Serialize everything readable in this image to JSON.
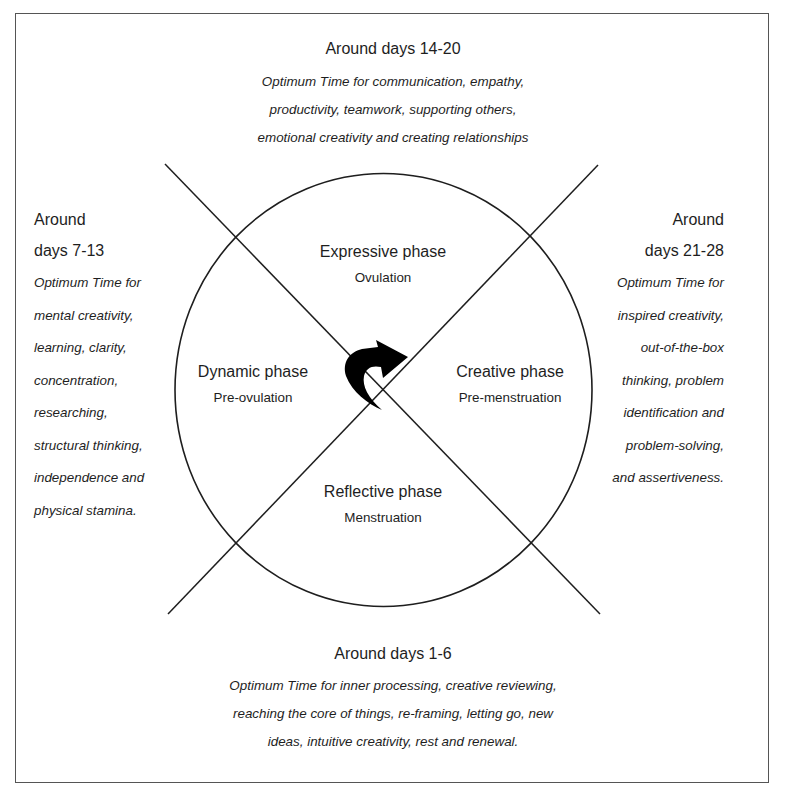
{
  "diagram": {
    "center_icon": "clockwise-curved-arrow-icon",
    "top": {
      "heading": "Around days 14-20",
      "lines": [
        "Optimum Time for communication, empathy,",
        "productivity, teamwork, supporting others,",
        "emotional creativity and creating relationships"
      ]
    },
    "left": {
      "heading_lines": [
        "Around",
        "days 7-13"
      ],
      "lines": [
        "Optimum Time for",
        "mental creativity,",
        "learning, clarity,",
        "concentration,",
        "researching,",
        "structural thinking,",
        "independence and",
        "physical stamina."
      ]
    },
    "right": {
      "heading_lines": [
        "Around",
        "days 21-28"
      ],
      "lines": [
        "Optimum Time for",
        "inspired creativity,",
        "out-of-the-box",
        "thinking, problem",
        "identification and",
        "problem-solving,",
        "and assertiveness."
      ]
    },
    "bottom": {
      "heading": "Around days 1-6",
      "lines": [
        "Optimum Time for inner processing, creative reviewing,",
        "reaching the core of things, re-framing, letting go, new",
        "ideas, intuitive creativity, rest and renewal."
      ]
    },
    "phases": {
      "top": {
        "name": "Expressive phase",
        "sub": "Ovulation"
      },
      "left": {
        "name": "Dynamic phase",
        "sub": "Pre-ovulation"
      },
      "right": {
        "name": "Creative phase",
        "sub": "Pre-menstruation"
      },
      "bottom": {
        "name": "Reflective phase",
        "sub": "Menstruation"
      }
    },
    "colors": {
      "stroke": "#1e1e1e",
      "frame": "#555555",
      "background": "#ffffff"
    }
  }
}
